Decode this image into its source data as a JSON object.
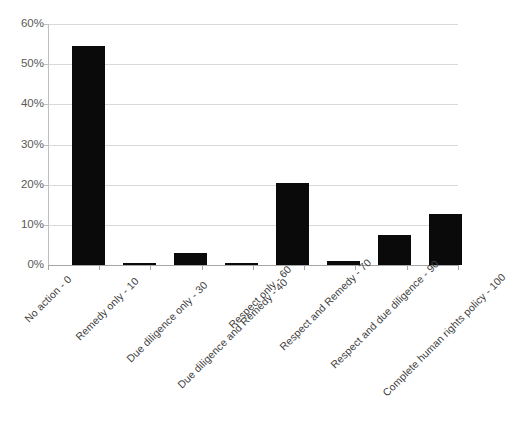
{
  "chart_data": {
    "type": "bar",
    "title": "",
    "xlabel": "",
    "ylabel": "",
    "ylim": [
      0,
      60
    ],
    "ytick_labels": [
      "0%",
      "10%",
      "20%",
      "30%",
      "40%",
      "50%",
      "60%"
    ],
    "ytick_values": [
      0,
      10,
      20,
      30,
      40,
      50,
      60
    ],
    "grid": true,
    "legend": "none",
    "bar_color": "#0a0a0a",
    "gridline_color": "#d9d9d9",
    "axis_color": "#a6a6a6",
    "categories": [
      "No action - 0",
      "Remedy only - 10",
      "Due diligence only - 30",
      "Due diligence and Remedy - 40",
      "Respect only - 60",
      "Respect and Remedy - 70",
      "Respect and due diligence - 90",
      "Complete human rights policy - 100"
    ],
    "values": [
      54.5,
      0.4,
      3.0,
      0.4,
      20.3,
      1.0,
      7.5,
      12.7
    ],
    "value_labels": [
      "54.5%",
      "0.4%",
      "3.0%",
      "0.4%",
      "20.3%",
      "1.0%",
      "7.5%",
      "12.7%"
    ]
  }
}
